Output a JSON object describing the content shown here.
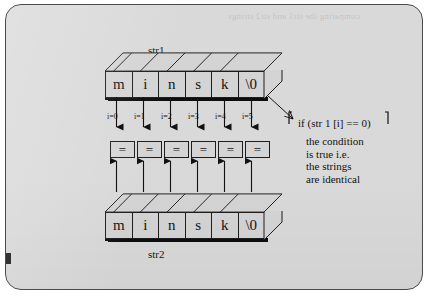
{
  "figure": {
    "background_color": "#d9d9d9",
    "page_color": "#ffffff",
    "border_color": "#4a4a4a",
    "ghost_text": "comparing the str1 and str2 strings"
  },
  "top_array": {
    "label": "str1",
    "cells": [
      "m",
      "i",
      "n",
      "s",
      "k",
      "\\0"
    ]
  },
  "bottom_array": {
    "label": "str2",
    "cells": [
      "m",
      "i",
      "n",
      "s",
      "k",
      "\\0"
    ]
  },
  "index_labels": [
    "i=0",
    "i=1",
    "i=2",
    "i=3",
    "i=4",
    "i=5"
  ],
  "comparators": [
    "=",
    "=",
    "=",
    "=",
    "=",
    "="
  ],
  "annotation": {
    "code": "if (str 1 [i] == 0)",
    "lines": [
      "the condition",
      "is true i.e.",
      "the strings",
      "are identical"
    ]
  }
}
